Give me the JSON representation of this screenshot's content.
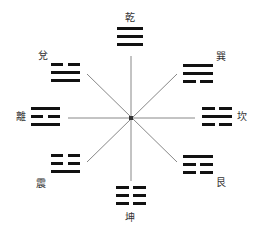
{
  "diagram": {
    "center": [
      131,
      118
    ],
    "line_color": "#888888",
    "bar_color": "#111111",
    "spokes": [
      {
        "x1": 131,
        "y1": 56,
        "x2": 131,
        "y2": 181
      },
      {
        "x1": 68,
        "y1": 118,
        "x2": 195,
        "y2": 118
      },
      {
        "x1": 87,
        "y1": 74,
        "x2": 177,
        "y2": 162
      },
      {
        "x1": 177,
        "y1": 74,
        "x2": 87,
        "y2": 162
      }
    ],
    "trigrams": [
      {
        "name": "乾",
        "position": "top",
        "lines": [
          1,
          1,
          1
        ],
        "x": 117,
        "y": 27,
        "w": 26,
        "label_x": 124,
        "label_y": 12
      },
      {
        "name": "巽",
        "position": "top-right",
        "lines": [
          1,
          1,
          0
        ],
        "x": 183,
        "y": 64,
        "w": 30,
        "label_x": 215,
        "label_y": 51
      },
      {
        "name": "坎",
        "position": "right",
        "lines": [
          0,
          1,
          0
        ],
        "x": 202,
        "y": 107,
        "w": 30,
        "label_x": 236,
        "label_y": 111
      },
      {
        "name": "艮",
        "position": "bottom-right",
        "lines": [
          1,
          0,
          0
        ],
        "x": 183,
        "y": 155,
        "w": 30,
        "label_x": 215,
        "label_y": 177
      },
      {
        "name": "坤",
        "position": "bottom",
        "lines": [
          0,
          0,
          0
        ],
        "x": 116,
        "y": 186,
        "w": 30,
        "label_x": 124,
        "label_y": 212
      },
      {
        "name": "震",
        "position": "bottom-left",
        "lines": [
          0,
          0,
          1
        ],
        "x": 51,
        "y": 154,
        "w": 29,
        "label_x": 35,
        "label_y": 178
      },
      {
        "name": "離",
        "position": "left",
        "lines": [
          1,
          0,
          1
        ],
        "x": 31,
        "y": 107,
        "w": 29,
        "label_x": 15,
        "label_y": 111
      },
      {
        "name": "兌",
        "position": "top-left",
        "lines": [
          0,
          1,
          1
        ],
        "x": 51,
        "y": 63,
        "w": 29,
        "label_x": 37,
        "label_y": 50
      }
    ]
  }
}
